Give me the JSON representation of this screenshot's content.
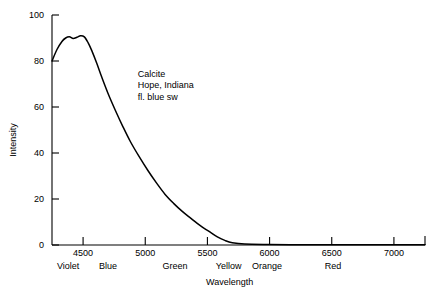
{
  "chart_data": {
    "type": "line",
    "title": "",
    "subtitle": "",
    "xlabel": "Wavelength",
    "ylabel": "Intensity",
    "xlim": [
      4250,
      7250
    ],
    "ylim": [
      0,
      100
    ],
    "grid": false,
    "legend": "none",
    "xticks": [
      4500,
      5000,
      5500,
      6000,
      6500,
      7000
    ],
    "xtick_labels": [
      "4500",
      "5000",
      "5500",
      "6000",
      "6500",
      "7000"
    ],
    "yticks": [
      0,
      20,
      40,
      60,
      80,
      100
    ],
    "ytick_labels": [
      "0",
      "20",
      "40",
      "60",
      "80",
      "100"
    ],
    "series": [
      {
        "name": "Calcite emission",
        "x": [
          4250,
          4290,
          4330,
          4360,
          4390,
          4420,
          4450,
          4480,
          4510,
          4540,
          4570,
          4610,
          4650,
          4700,
          4760,
          4820,
          4880,
          4950,
          5020,
          5090,
          5160,
          5230,
          5300,
          5370,
          5440,
          5510,
          5580,
          5640,
          5700,
          5800,
          6000,
          6250,
          6500,
          6750,
          7000,
          7250
        ],
        "y": [
          80,
          85,
          88.5,
          90,
          90.5,
          89.8,
          90.3,
          91,
          90.5,
          88,
          84.5,
          79,
          73,
          66,
          58.5,
          51.5,
          45,
          38.5,
          32.5,
          27,
          22,
          18,
          14.5,
          11.5,
          8.5,
          6,
          3.5,
          2,
          1,
          0.4,
          0.2,
          0.1,
          0.1,
          0.1,
          0.1,
          0.1
        ]
      }
    ],
    "annotations": [
      {
        "name": "sample-annotation",
        "lines": [
          "Calcite",
          "Hope, Indiana",
          "fl. blue sw"
        ],
        "x": 4940,
        "y": 74
      }
    ],
    "spectral_bands": [
      {
        "label": "Violet",
        "center": 4380
      },
      {
        "label": "Blue",
        "center": 4700
      },
      {
        "label": "Green",
        "center": 5240
      },
      {
        "label": "Yellow",
        "center": 5670
      },
      {
        "label": "Orange",
        "center": 5980
      },
      {
        "label": "Red",
        "center": 6510
      }
    ],
    "line_color": "#000000",
    "axis_color": "#000000",
    "background_color": "#ffffff"
  }
}
